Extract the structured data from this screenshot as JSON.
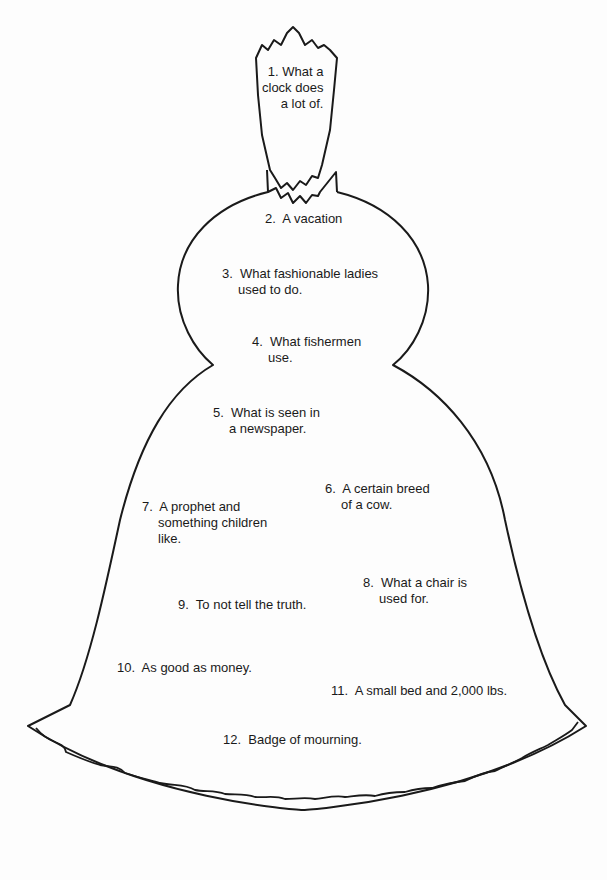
{
  "puzzle": {
    "shape": "bell",
    "clues": [
      {
        "number": "1.",
        "lines": [
          "What a",
          "clock does",
          "a lot of."
        ]
      },
      {
        "number": "2.",
        "lines": [
          "A vacation"
        ]
      },
      {
        "number": "3.",
        "lines": [
          "What fashionable ladies",
          "used to do."
        ]
      },
      {
        "number": "4.",
        "lines": [
          "What fishermen",
          "use."
        ]
      },
      {
        "number": "5.",
        "lines": [
          "What is seen in",
          "a newspaper."
        ]
      },
      {
        "number": "6.",
        "lines": [
          "A certain breed",
          "of a cow."
        ]
      },
      {
        "number": "7.",
        "lines": [
          "A prophet and",
          "something children",
          "like."
        ]
      },
      {
        "number": "8.",
        "lines": [
          "What a chair is",
          "used for."
        ]
      },
      {
        "number": "9.",
        "lines": [
          "To not tell the truth."
        ]
      },
      {
        "number": "10.",
        "lines": [
          "As good as money."
        ]
      },
      {
        "number": "11.",
        "lines": [
          "A small bed and 2,000 lbs."
        ]
      },
      {
        "number": "12.",
        "lines": [
          "Badge of mourning."
        ]
      }
    ]
  },
  "colors": {
    "ink": "#1a1a1a",
    "paper": "#fdfdfd"
  }
}
